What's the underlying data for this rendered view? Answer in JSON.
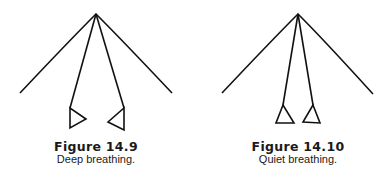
{
  "figures": [
    {
      "label": "Figure 14.9",
      "caption": "Deep breathing.",
      "diagram": {
        "apex": [
          96,
          14
        ],
        "arms": [
          [
            20,
            93
          ],
          [
            172,
            93
          ]
        ],
        "legs": [
          [
            70,
            108
          ],
          [
            124,
            108
          ]
        ],
        "triangles": [
          [
            [
              70,
              108
            ],
            [
              70,
              128
            ],
            [
              86,
              119
            ]
          ],
          [
            [
              124,
              108
            ],
            [
              124,
              130
            ],
            [
              108,
              122
            ]
          ]
        ]
      }
    },
    {
      "label": "Figure 14.10",
      "caption": "Quiet breathing.",
      "diagram": {
        "apex": [
          298,
          14
        ],
        "arms": [
          [
            222,
            93
          ],
          [
            373,
            94
          ]
        ],
        "legs": [
          [
            283,
            105
          ],
          [
            313,
            105
          ]
        ],
        "triangles": [
          [
            [
              283,
              105
            ],
            [
              276,
              123
            ],
            [
              294,
              123
            ]
          ],
          [
            [
              313,
              105
            ],
            [
              303,
              122
            ],
            [
              320,
              123
            ]
          ]
        ]
      }
    }
  ],
  "colors": {
    "stroke": "#111111",
    "background": "#ffffff"
  }
}
